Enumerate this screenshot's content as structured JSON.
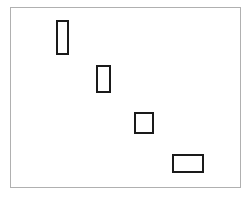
{
  "figure": {
    "title": "",
    "background_color": "#ffffff",
    "canvas": {
      "width": 251,
      "height": 197
    },
    "frame": {
      "label": "figure-border",
      "x": 10,
      "y": 7,
      "width": 231,
      "height": 181,
      "border_width": 1,
      "border_color": "#b0b0b0",
      "fill_color": "#ffffff"
    },
    "shapes": [
      {
        "label": "rectangle-1",
        "name": "tall-narrow-rectangle",
        "x": 56,
        "y": 20,
        "width": 13,
        "height": 35,
        "border_width": 2,
        "border_color": "#1a1a1a",
        "fill_color": "#ffffff",
        "aspect_ratio": "0.37"
      },
      {
        "label": "rectangle-2",
        "name": "tall-rectangle",
        "x": 96,
        "y": 65,
        "width": 15,
        "height": 28,
        "border_width": 2,
        "border_color": "#1a1a1a",
        "fill_color": "#ffffff",
        "aspect_ratio": "0.54"
      },
      {
        "label": "rectangle-3",
        "name": "square-rectangle",
        "x": 134,
        "y": 112,
        "width": 20,
        "height": 22,
        "border_width": 2,
        "border_color": "#1a1a1a",
        "fill_color": "#ffffff",
        "aspect_ratio": "0.91"
      },
      {
        "label": "rectangle-4",
        "name": "wide-rectangle",
        "x": 172,
        "y": 154,
        "width": 32,
        "height": 19,
        "border_width": 2,
        "border_color": "#1a1a1a",
        "fill_color": "#ffffff",
        "aspect_ratio": "1.68"
      }
    ]
  }
}
